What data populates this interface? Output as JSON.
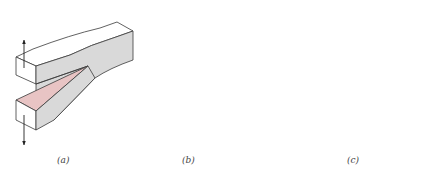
{
  "figure": {
    "panels": [
      {
        "id": "a",
        "label": "(a)",
        "mode": "opening"
      },
      {
        "id": "b",
        "label": "(b)",
        "mode": "sliding"
      },
      {
        "id": "c",
        "label": "(c)",
        "mode": "tearing"
      }
    ]
  },
  "colors": {
    "crack_face": "#e8c4c4",
    "side_face": "#d9d9d9",
    "top_face": "#ffffff",
    "edge": "#3a3a3a"
  }
}
